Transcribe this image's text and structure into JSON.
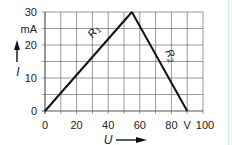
{
  "chart_data": {
    "type": "line",
    "title": "",
    "xlabel": "U",
    "ylabel": "I",
    "x_unit": "V",
    "y_unit": "mA",
    "xlim": [
      0,
      100
    ],
    "ylim": [
      0,
      30
    ],
    "x_ticks": [
      0,
      20,
      40,
      60,
      80,
      100
    ],
    "x_tick_labels": [
      "0",
      "20",
      "40",
      "60",
      "80",
      "100"
    ],
    "y_ticks": [
      0,
      10,
      20,
      30
    ],
    "y_tick_labels": [
      "0",
      "10",
      "20",
      "30"
    ],
    "grid": true,
    "grid_x_step": 10,
    "grid_y_step": 5,
    "series": [
      {
        "name": "R1",
        "label_main": "R",
        "label_sub": "1",
        "x": [
          0,
          55
        ],
        "y": [
          0,
          30
        ]
      },
      {
        "name": "R2",
        "label_main": "R",
        "label_sub": "2",
        "x": [
          55,
          90
        ],
        "y": [
          30,
          0
        ]
      }
    ],
    "colors": {
      "line": "#111111",
      "grid": "#555555",
      "text": "#222222",
      "edge": "#d6ece6"
    }
  }
}
